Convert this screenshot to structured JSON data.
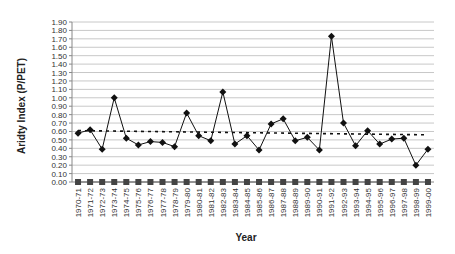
{
  "chart_data": {
    "type": "line",
    "title": "",
    "xlabel": "Year",
    "ylabel": "Aridty Index (P/PET)",
    "ylim": [
      0,
      1.9
    ],
    "ytick_step": 0.1,
    "yticks": [
      "0.00",
      "0.10",
      "0.20",
      "0.30",
      "0.40",
      "0.50",
      "0.60",
      "0.70",
      "0.80",
      "0.90",
      "1.00",
      "1.10",
      "1.20",
      "1.30",
      "1.40",
      "1.50",
      "1.60",
      "1.70",
      "1.80",
      "1.90"
    ],
    "grid": true,
    "legend": null,
    "categories": [
      "1970-71",
      "1971-72",
      "1972-73",
      "1973-74",
      "1974-75",
      "1975-76",
      "1976-77",
      "1977-78",
      "1978-79",
      "1979-80",
      "1980-81",
      "1981-82",
      "1982-83",
      "1983-84",
      "1984-85",
      "1985-86",
      "1986-87",
      "1987-88",
      "1988-89",
      "1989-90",
      "1990-91",
      "1991-92",
      "1992-93",
      "1993-94",
      "1994-95",
      "1995-96",
      "1996-97",
      "1997-98",
      "1998-99",
      "1999-00"
    ],
    "series": [
      {
        "name": "Aridity Index",
        "marker": "diamond",
        "color": "#111111",
        "values": [
          0.58,
          0.62,
          0.39,
          1.0,
          0.52,
          0.44,
          0.48,
          0.47,
          0.42,
          0.82,
          0.55,
          0.49,
          1.07,
          0.45,
          0.55,
          0.38,
          0.69,
          0.75,
          0.49,
          0.53,
          0.38,
          1.73,
          0.7,
          0.43,
          0.61,
          0.45,
          0.51,
          0.52,
          0.2,
          0.39
        ]
      },
      {
        "name": "Zero baseline",
        "marker": "square",
        "color": "#444444",
        "values": [
          0,
          0,
          0,
          0,
          0,
          0,
          0,
          0,
          0,
          0,
          0,
          0,
          0,
          0,
          0,
          0,
          0,
          0,
          0,
          0,
          0,
          0,
          0,
          0,
          0,
          0,
          0,
          0,
          0,
          0
        ]
      },
      {
        "name": "Linear trend",
        "style": "dashed",
        "color": "#111111",
        "start": 0.61,
        "end": 0.56
      }
    ]
  }
}
